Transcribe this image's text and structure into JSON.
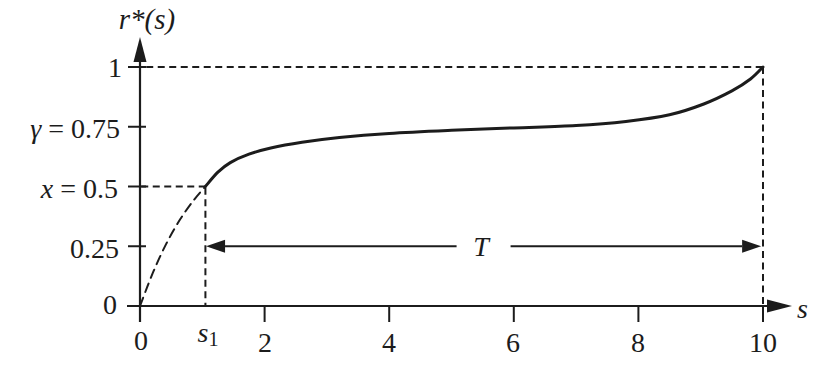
{
  "figure": {
    "background": "#ffffff",
    "ink_color": "#1c1c1c"
  },
  "chart_data": {
    "type": "line",
    "title": "",
    "xlabel": "s",
    "ylabel": "r*(s)",
    "xlim": [
      0,
      10
    ],
    "ylim": [
      0,
      1
    ],
    "x_ticks": [
      {
        "value": 0,
        "label": "0",
        "tick": false
      },
      {
        "value": 1.05,
        "label": "s1",
        "tick": false
      },
      {
        "value": 2,
        "label": "2",
        "tick": true
      },
      {
        "value": 4,
        "label": "4",
        "tick": true
      },
      {
        "value": 6,
        "label": "6",
        "tick": true
      },
      {
        "value": 8,
        "label": "8",
        "tick": true
      },
      {
        "value": 10,
        "label": "10",
        "tick": true
      }
    ],
    "y_ticks": [
      {
        "value": 0,
        "label": "0",
        "tick": false
      },
      {
        "value": 0.25,
        "label": "0.25",
        "tick": true
      },
      {
        "value": 0.5,
        "label": "x = 0.5",
        "tick": true
      },
      {
        "value": 0.75,
        "label": "γ = 0.75",
        "tick": true
      },
      {
        "value": 1,
        "label": "1",
        "tick": true
      }
    ],
    "s1_x": 1.05,
    "series": [
      {
        "name": "r-star-before-s1",
        "style": "dashed",
        "points": [
          [
            0,
            0
          ],
          [
            0.2,
            0.135
          ],
          [
            0.42,
            0.26
          ],
          [
            0.65,
            0.365
          ],
          [
            0.87,
            0.445
          ],
          [
            1.05,
            0.5
          ]
        ]
      },
      {
        "name": "r-star-after-s1",
        "style": "solid",
        "points": [
          [
            1.05,
            0.5
          ],
          [
            1.25,
            0.56
          ],
          [
            1.45,
            0.6
          ],
          [
            1.75,
            0.635
          ],
          [
            2.1,
            0.661
          ],
          [
            2.6,
            0.685
          ],
          [
            3.2,
            0.705
          ],
          [
            4,
            0.722
          ],
          [
            5,
            0.735
          ],
          [
            6,
            0.745
          ],
          [
            7,
            0.755
          ],
          [
            7.8,
            0.772
          ],
          [
            8.5,
            0.8
          ],
          [
            9.05,
            0.845
          ],
          [
            9.5,
            0.9
          ],
          [
            9.8,
            0.95
          ],
          [
            10,
            1.0
          ]
        ]
      }
    ],
    "guides": [
      {
        "type": "h",
        "y": 1,
        "from_x": 0.1,
        "to_x": 10
      },
      {
        "type": "v",
        "x": 10,
        "from_y": 0,
        "to_y": 1
      },
      {
        "type": "h",
        "y": 0.5,
        "from_x": 0.02,
        "to_x": 1.05
      },
      {
        "type": "v",
        "x": 1.05,
        "from_y": 0,
        "to_y": 0.495
      }
    ],
    "annotations": [
      {
        "type": "double-arrow",
        "label": "T",
        "y": 0.25,
        "from_x": 1.06,
        "to_x": 9.97
      }
    ],
    "grid": false,
    "legend": null
  },
  "labels": {
    "y_axis_title": "r*(s)",
    "x_axis_title": "s",
    "y_tick_1": "1",
    "y_tick_075_var": "γ",
    "y_tick_075_rest": " = 0.75",
    "y_tick_05_var": "x",
    "y_tick_05_rest": " = 0.5",
    "y_tick_025": "0.25",
    "y_tick_0": "0",
    "x_tick_0": "0",
    "x_tick_s1_base": "s",
    "x_tick_s1_sub": "1",
    "x_tick_2": "2",
    "x_tick_4": "4",
    "x_tick_6": "6",
    "x_tick_8": "8",
    "x_tick_10": "10",
    "t_label": "T"
  }
}
